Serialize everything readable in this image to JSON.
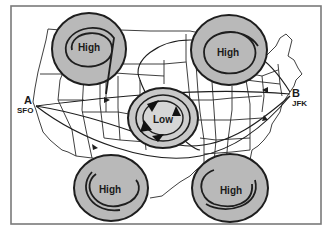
{
  "figure": {
    "colors": {
      "frame": "#7a7a7a",
      "fill": "#b9b9b9",
      "stroke": "#1e1e1e",
      "map_lines": "#2a2a2a",
      "background": "#ffffff"
    }
  },
  "pressure_systems": [
    {
      "id": "high-nw",
      "label": "High",
      "type": "high",
      "cx": 89,
      "cy": 49,
      "rx": 37,
      "ry": 36
    },
    {
      "id": "high-ne",
      "label": "High",
      "type": "high",
      "cx": 229,
      "cy": 50,
      "rx": 38,
      "ry": 35
    },
    {
      "id": "low-center",
      "label": "Low",
      "type": "low",
      "cx": 163,
      "cy": 118,
      "rx": 35,
      "ry": 30
    },
    {
      "id": "high-sw",
      "label": "High",
      "type": "high",
      "cx": 111,
      "cy": 188,
      "rx": 37,
      "ry": 33
    },
    {
      "id": "high-se",
      "label": "High",
      "type": "high",
      "cx": 230,
      "cy": 188,
      "rx": 38,
      "ry": 34
    }
  ],
  "points": {
    "origin": {
      "letter": "A",
      "code": "SFO",
      "x": 34,
      "y": 105
    },
    "destination": {
      "letter": "B",
      "code": "JFK",
      "x": 290,
      "y": 93
    }
  }
}
